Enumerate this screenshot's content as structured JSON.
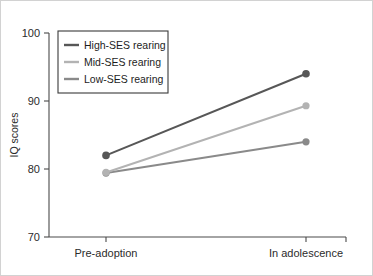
{
  "chart_data": {
    "type": "line",
    "title": "",
    "subtitle": "",
    "xlabel": "",
    "ylabel": "IQ scores",
    "categories": [
      "Pre-adoption",
      "In adolescence"
    ],
    "x": [
      0,
      1
    ],
    "ylim": [
      70,
      100
    ],
    "yticks": [
      70,
      80,
      90,
      100
    ],
    "ytick_labels": [
      "70",
      "80",
      "90",
      "100"
    ],
    "grid": false,
    "legend_position": "top-left",
    "series": [
      {
        "name": "High-SES rearing",
        "values": [
          82.0,
          94.0
        ],
        "color": "#575757"
      },
      {
        "name": "Mid-SES rearing",
        "values": [
          79.5,
          89.3
        ],
        "color": "#b3b3b3"
      },
      {
        "name": "Low-SES rearing",
        "values": [
          79.4,
          84.0
        ],
        "color": "#8a8a8a"
      }
    ],
    "annotations": []
  },
  "axis": {
    "y_title": "IQ scores",
    "y_tick_100": "100",
    "y_tick_90": "90",
    "y_tick_80": "80",
    "y_tick_70": "70",
    "x_cat_0": "Pre-adoption",
    "x_cat_1": "In adolescence"
  },
  "legend": {
    "entries": [
      {
        "label": "High-SES rearing"
      },
      {
        "label": "Mid-SES rearing"
      },
      {
        "label": "Low-SES rearing"
      }
    ]
  },
  "colors": {
    "high_ses": "#575757",
    "mid_ses": "#b3b3b3",
    "low_ses": "#8a8a8a",
    "axis": "#4a4a4a",
    "text": "#2b2b2b",
    "background": "#ffffff",
    "border": "#d2d2d2"
  }
}
